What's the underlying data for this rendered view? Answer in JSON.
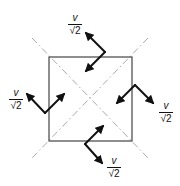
{
  "diagram": {
    "colors": {
      "background": "#ffffff",
      "square_stroke": "#444444",
      "diagonal_stroke": "#aaaaaa",
      "arrow_stroke": "#111111"
    },
    "square": {
      "x1": 49,
      "y1": 57,
      "x2": 132,
      "y2": 141
    },
    "diagonals": [
      {
        "x1": 32,
        "y1": 38,
        "x2": 148,
        "y2": 158
      },
      {
        "x1": 148,
        "y1": 38,
        "x2": 32,
        "y2": 158
      }
    ],
    "arrow_groups": [
      {
        "name": "top",
        "vertex": [
          105,
          52
        ],
        "tips": [
          [
            86,
            33
          ],
          [
            86,
            71
          ]
        ],
        "label": {
          "numerator": "v",
          "denominator": "√2",
          "x": 75,
          "y": 22
        }
      },
      {
        "name": "left",
        "vertex": [
          45,
          113
        ],
        "tips": [
          [
            27,
            94
          ],
          [
            64,
            94
          ]
        ],
        "label": {
          "numerator": "v",
          "denominator": "√2",
          "x": 16,
          "y": 97
        }
      },
      {
        "name": "right",
        "vertex": [
          135,
          85
        ],
        "tips": [
          [
            117,
            103
          ],
          [
            153,
            103
          ]
        ],
        "label": {
          "numerator": "v",
          "denominator": "√2",
          "x": 166,
          "y": 110
        }
      },
      {
        "name": "bottom",
        "vertex": [
          85,
          144
        ],
        "tips": [
          [
            103,
            126
          ],
          [
            102,
            163
          ]
        ],
        "label": {
          "numerator": "v",
          "denominator": "√2",
          "x": 114,
          "y": 165
        }
      }
    ]
  }
}
